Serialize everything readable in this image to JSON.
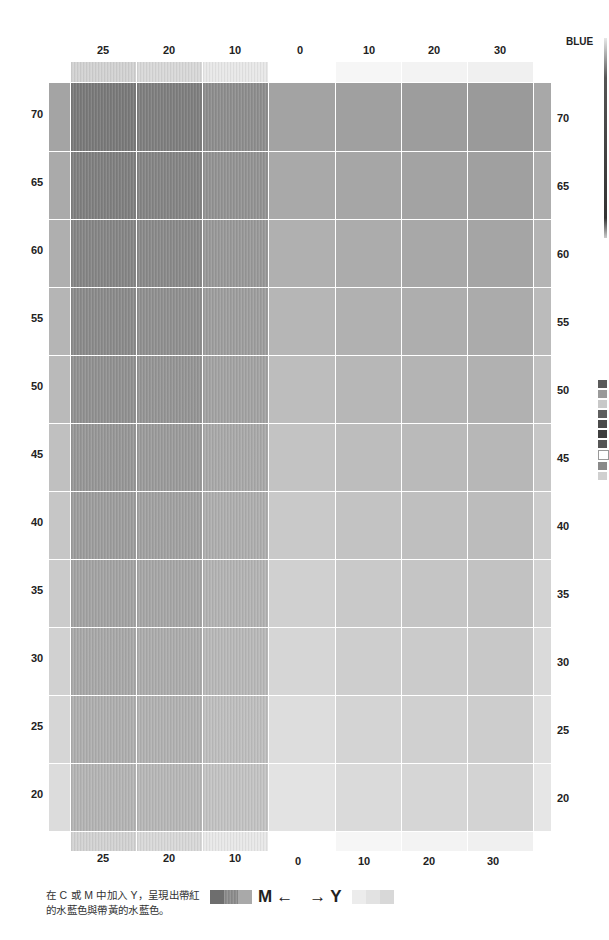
{
  "title": "BLUE",
  "column_labels": [
    "25",
    "20",
    "10",
    "0",
    "10",
    "20",
    "30"
  ],
  "column_groups": {
    "left": "M",
    "right": "Y"
  },
  "row_labels": [
    "70",
    "65",
    "60",
    "55",
    "50",
    "45",
    "40",
    "35",
    "30",
    "25",
    "20"
  ],
  "caption_lines": [
    "在 C 或 M 中加入 Y，呈現出帶紅",
    "的水藍色與帶黃的水藍色。"
  ],
  "legend": {
    "left_label": "M",
    "left_arrow": "←",
    "right_arrow": "→",
    "right_label": "Y",
    "left_swatches": [
      "#6e6e6e",
      "#8c8c8c",
      "#a9a9a9"
    ],
    "right_swatches": [
      "#ececec",
      "#e2e2e2",
      "#d8d8d8"
    ]
  },
  "colors": {
    "grid_line": "#ffffff",
    "text": "#222222"
  },
  "chart_data": {
    "type": "heatmap",
    "title": "BLUE",
    "xlabel": "M ← → Y",
    "ylabel": "C",
    "x": [
      "M25",
      "M20",
      "M10",
      "0",
      "Y10",
      "Y20",
      "Y30"
    ],
    "y": [
      70,
      65,
      60,
      55,
      50,
      45,
      40,
      35,
      30,
      25,
      20
    ],
    "gray_values_top_row": [
      "#7a7a7a",
      "#7f7f7f",
      "#8e8e8e",
      "#a3a3a3",
      "#a0a0a0",
      "#9d9d9d",
      "#9a9a9a"
    ],
    "gray_values_bottom_row": [
      "#b4b4b4",
      "#b7b7b7",
      "#c3c3c3",
      "#e3e3e3",
      "#dadada",
      "#d6d6d6",
      "#d3d3d3"
    ],
    "grid": true
  },
  "side_swatches": [
    "#5a5a5a",
    "#9a9a9a",
    "#c8c8c8",
    "#5e5e5e",
    "#4a4a4a",
    "#3e3e3e",
    "#555555",
    "#ffffff",
    "#8a8a8a",
    "#d0d0d0"
  ]
}
